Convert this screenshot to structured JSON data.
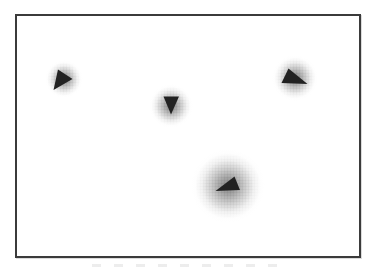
{
  "figure": {
    "kind": "scanned-figure",
    "frame": {
      "x": 15,
      "y": 14,
      "width": 346,
      "height": 244,
      "border_color": "#3b3b3b"
    },
    "background_color": "#ffffff",
    "triangle_color": "#222222",
    "glow_center_color": "#808080",
    "markers": [
      {
        "id": "top-left",
        "direction": "east",
        "center": {
          "x": 64,
          "y": 79
        },
        "glow_radius": 19,
        "points": "58,69.5 72.5,79 53.5,90"
      },
      {
        "id": "center",
        "direction": "south",
        "center": {
          "x": 171,
          "y": 106
        },
        "glow_radius": 22,
        "points": "163.5,96.5 179,96.5 171,114.5"
      },
      {
        "id": "top-right",
        "direction": "north-west",
        "center": {
          "x": 295,
          "y": 78
        },
        "glow_radius": 23,
        "points": "288.5,68.5 281.5,83 307.5,84"
      },
      {
        "id": "bottom-center",
        "direction": "north-east",
        "center": {
          "x": 228,
          "y": 186
        },
        "glow_radius": 37,
        "points": "234.5,176.5 215.5,191 240,190"
      }
    ],
    "caption_artifact_present": true
  }
}
